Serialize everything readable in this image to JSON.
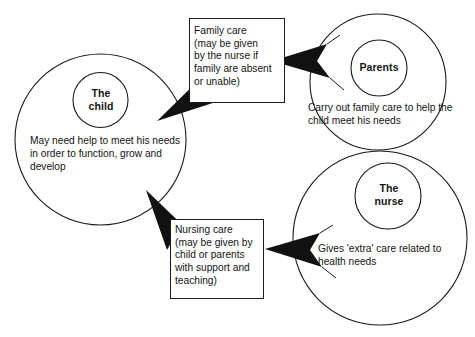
{
  "diagram": {
    "background_color": "#ffffff",
    "line_color": "#1a1a1a",
    "arrow_color": "#111111",
    "text_color": "#141414",
    "circles": [
      {
        "id": "child",
        "title": "The\nchild",
        "title_line1": "The",
        "title_line2": "child",
        "body": "May need help to meet his needs in order to function, grow and develop"
      },
      {
        "id": "parents",
        "title": "Parents",
        "title_line1": "Parents",
        "title_line2": "",
        "body": "Carry out family care to help the child meet his needs"
      },
      {
        "id": "nurse",
        "title": "The\nnurse",
        "title_line1": "The",
        "title_line2": "nurse",
        "body": "Gives 'extra' care related to health needs"
      }
    ],
    "callouts": [
      {
        "id": "family-care",
        "text": "Family care\n(may be given\nby the nurse if\nfamily are absent\nor unable)"
      },
      {
        "id": "nursing-care",
        "text": "Nursing care\n(may be given by\nchild or parents\nwith support and\nteaching)"
      }
    ],
    "arrows": [
      {
        "id": "parents-to-family-care",
        "direction": "left"
      },
      {
        "id": "family-care-to-child",
        "direction": "down-left"
      },
      {
        "id": "nursing-care-to-child",
        "direction": "up-left"
      },
      {
        "id": "nurse-to-nursing-care",
        "direction": "left"
      }
    ]
  }
}
